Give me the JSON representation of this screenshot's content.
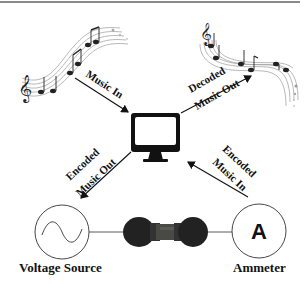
{
  "diagram": {
    "labels": {
      "music_in": "Music In",
      "decoded_line1": "Decoded",
      "decoded_line2": "Music Out",
      "encoded_out_line1": "Encoded",
      "encoded_out_line2": "Music Out",
      "encoded_in_line1": "Encoded",
      "encoded_in_line2": "Music In",
      "voltage_source": "Voltage Source",
      "ammeter": "Ammeter",
      "ammeter_symbol": "A"
    },
    "icons": {
      "left_music": "music-staff-notes-icon",
      "right_music": "music-staff-notes-icon",
      "computer": "monitor-icon",
      "voltage": "ac-voltage-source-icon",
      "ammeter": "ammeter-icon",
      "device": "device-sample-icon"
    },
    "colors": {
      "stroke": "#111111",
      "frame_top": "#8a8a8a",
      "staff": "#999999"
    }
  }
}
